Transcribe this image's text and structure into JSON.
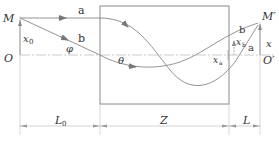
{
  "diagram": {
    "points": {
      "M": "M",
      "O": "O",
      "M_prime": "M′",
      "O_prime": "O′"
    },
    "rays": {
      "a_left": "a",
      "b_left": "b",
      "a_right": "a",
      "b_right": "b"
    },
    "angles": {
      "phi": "φ",
      "theta": "θ"
    },
    "offsets": {
      "x0": "x",
      "x0_sub": "0",
      "xa": "x",
      "xa_sub": "a",
      "xb": "x",
      "xb_sub": "b",
      "x": "x"
    },
    "dimensions": {
      "L0": "L",
      "L0_sub": "0",
      "Z": "Z",
      "L": "L"
    },
    "colors": {
      "line": "#7a7a7a",
      "axis": "#b0b0b0",
      "text": "#333333"
    }
  }
}
